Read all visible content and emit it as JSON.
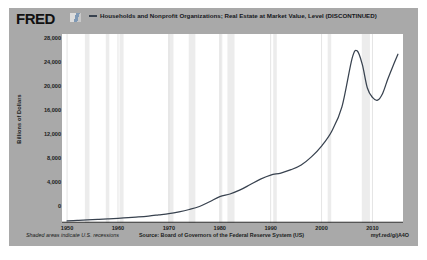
{
  "brand": {
    "logo_text": "FRED",
    "mark_name": "fred-logo-mark"
  },
  "legend": {
    "series_label": "Households and Nonprofit Organizations; Real Estate at Market Value, Level (DISCONTINUED)",
    "line_color": "#38424f"
  },
  "footer": {
    "recession_note": "Shaded areas indicate U.S. recessions",
    "source_note": "Source: Board of Governors of the Federal Reserve System (US)",
    "short_url": "myf.red/g/jA4O"
  },
  "colors": {
    "card_background": "#a9a9a9",
    "plot_background": "#ffffff",
    "recession_band": "#ececec",
    "gridline": "#d9d9d9",
    "axis_line": "#1d1d1d",
    "series_line": "#38424f"
  },
  "chart_data": {
    "type": "line",
    "title": "Households and Nonprofit Organizations; Real Estate at Market Value, Level (DISCONTINUED)",
    "xlabel": "",
    "ylabel": "Billions of Dollars",
    "xlim": [
      1949,
      2016
    ],
    "ylim": [
      0,
      28000
    ],
    "grid": true,
    "legend_position": "top",
    "y_ticks": [
      28000,
      24000,
      20000,
      16000,
      12000,
      8000,
      4000,
      0
    ],
    "y_tick_labels": [
      "28,000",
      "24,000",
      "20,000",
      "16,000",
      "12,000",
      "8,000",
      "4,000",
      "0"
    ],
    "x_ticks": [
      1950,
      1960,
      1970,
      1980,
      1990,
      2000,
      2010
    ],
    "x_tick_labels": [
      "1950",
      "1960",
      "1970",
      "1980",
      "1990",
      "2000",
      "2010"
    ],
    "series": [
      {
        "name": "Households and Nonprofit Organizations; Real Estate at Market Value, Level (DISCONTINUED)",
        "color": "#38424f",
        "x": [
          1950,
          1952,
          1954,
          1956,
          1958,
          1960,
          1962,
          1964,
          1966,
          1968,
          1970,
          1972,
          1974,
          1976,
          1978,
          1980,
          1982,
          1984,
          1986,
          1988,
          1990,
          1992,
          1994,
          1996,
          1998,
          2000,
          2002,
          2004,
          2006,
          2007,
          2008,
          2009,
          2010,
          2011,
          2012,
          2013,
          2014,
          2015
        ],
        "values": [
          300,
          380,
          450,
          540,
          620,
          700,
          800,
          900,
          1030,
          1200,
          1380,
          1650,
          2000,
          2450,
          3150,
          3900,
          4300,
          4900,
          5700,
          6500,
          7100,
          7400,
          7900,
          8600,
          9800,
          11400,
          13600,
          17200,
          24400,
          25500,
          23500,
          20000,
          18600,
          18200,
          19200,
          21300,
          23200,
          25000
        ]
      }
    ],
    "recession_bands": [
      {
        "start": 1953.5,
        "end": 1954.4
      },
      {
        "start": 1957.6,
        "end": 1958.3
      },
      {
        "start": 1960.3,
        "end": 1961.1
      },
      {
        "start": 1969.9,
        "end": 1970.9
      },
      {
        "start": 1973.9,
        "end": 1975.2
      },
      {
        "start": 1980.0,
        "end": 1980.5
      },
      {
        "start": 1981.5,
        "end": 1982.9
      },
      {
        "start": 1990.5,
        "end": 1991.2
      },
      {
        "start": 2001.2,
        "end": 2001.9
      },
      {
        "start": 2007.9,
        "end": 2009.5
      }
    ]
  }
}
